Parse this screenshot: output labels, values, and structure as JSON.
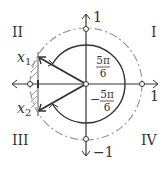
{
  "diagram": {
    "quadrants": {
      "q1": "I",
      "q2": "II",
      "q3": "III",
      "q4": "IV"
    },
    "axis_labels": {
      "y_top": "1",
      "x_right": "1",
      "y_bottom": "−1"
    },
    "points": {
      "x1": "x",
      "x1_sub": "1",
      "x2": "x",
      "x2_sub": "2"
    },
    "angles": {
      "upper": {
        "num": "5π",
        "den": "6",
        "sign": ""
      },
      "lower": {
        "num": "5π",
        "den": "6",
        "sign": "−"
      }
    },
    "colors": {
      "stroke": "#333333",
      "circle": "#999999",
      "hatch": "#888888"
    }
  }
}
